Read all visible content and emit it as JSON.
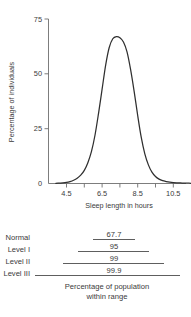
{
  "chart_data": {
    "type": "line",
    "title": "",
    "xlabel": "Sleep length in hours",
    "ylabel": "Percentage of individuals",
    "xlim": [
      3.9,
      11.6
    ],
    "ylim": [
      0,
      75
    ],
    "xticks": [
      4.5,
      5.5,
      6.5,
      7.5,
      8.5,
      9.5,
      10.5,
      11.5
    ],
    "xtick_labels": [
      "4.5",
      "",
      "6.5",
      "",
      "8.5",
      "",
      "10.5",
      ""
    ],
    "yticks": [
      0,
      25,
      50,
      75
    ],
    "ytick_labels": [
      "0",
      "25",
      "50",
      "75"
    ],
    "grid": false,
    "legend": "none",
    "curve_color": "#2f2f2f",
    "axis_color": "#6e6e6e",
    "distribution": {
      "kind": "normal-bell",
      "mean": 7.5,
      "peak_value": 67,
      "note": "Bell-shaped distribution of sleep length centered near 7.5 hours"
    },
    "x": [
      3.9,
      4.1,
      4.3,
      4.5,
      4.7,
      4.9,
      5.1,
      5.3,
      5.5,
      5.7,
      5.9,
      6.1,
      6.3,
      6.5,
      6.7,
      6.9,
      7.1,
      7.3,
      7.5,
      7.7,
      7.9,
      8.1,
      8.3,
      8.5,
      8.7,
      8.9,
      9.1,
      9.3,
      9.5,
      9.7,
      9.9,
      10.1,
      10.3,
      10.5,
      10.7,
      10.9,
      11.1,
      11.3,
      11.5
    ],
    "y": [
      0.1,
      0.2,
      0.3,
      0.5,
      0.9,
      1.5,
      2.4,
      3.8,
      6.0,
      9.5,
      14.5,
      22.0,
      32.0,
      43.0,
      54.0,
      62.0,
      66.0,
      67.0,
      66.5,
      64.5,
      60.0,
      52.0,
      42.0,
      31.0,
      21.0,
      13.5,
      8.5,
      5.2,
      3.2,
      2.0,
      1.3,
      0.9,
      0.6,
      0.4,
      0.3,
      0.25,
      0.2,
      0.15,
      0.1
    ]
  },
  "range_table": {
    "rows": [
      {
        "label": "Normal",
        "value": "67.7",
        "span_start": 6.5,
        "span_end": 8.5
      },
      {
        "label": "Level I",
        "value": "95",
        "span_start": 5.75,
        "span_end": 9.25
      },
      {
        "label": "Level II",
        "value": "99",
        "span_start": 5.0,
        "span_end": 10.0
      },
      {
        "label": "Level III",
        "value": "99.9",
        "span_start": 4.25,
        "span_end": 10.75
      }
    ],
    "caption_line1": "Percentage of population",
    "caption_line2": "within range"
  }
}
